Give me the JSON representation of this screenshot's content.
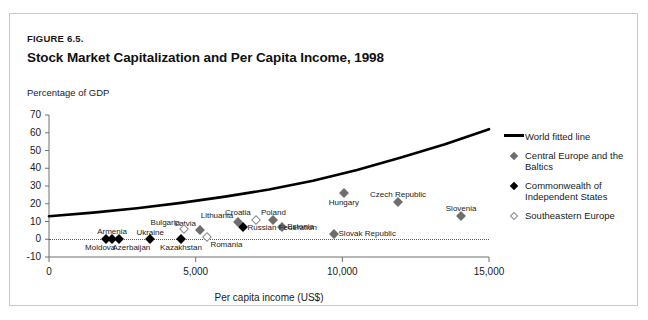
{
  "figure": {
    "label": "Figure 6.5.",
    "title": "Stock Market Capitalization and Per Capita Income, 1998"
  },
  "chart_data": {
    "type": "scatter",
    "title": "Stock Market Capitalization and Per Capita Income, 1998",
    "subtitle": "Figure 6.5.",
    "xlabel": "Per capita income (US$)",
    "ylabel": "Percentage of GDP",
    "xlim": [
      0,
      15000
    ],
    "ylim": [
      -10,
      70
    ],
    "xticks": [
      0,
      5000,
      10000,
      15000
    ],
    "xticklabels": [
      "0",
      "5,000",
      "10,000",
      "15,000"
    ],
    "yticks": [
      -10,
      0,
      10,
      20,
      30,
      40,
      50,
      60,
      70
    ],
    "yticklabels": [
      "-10",
      "0",
      "10",
      "20",
      "30",
      "40",
      "50",
      "60",
      "70"
    ],
    "grid": false,
    "zero_reference_line": true,
    "legend_position": "right",
    "series": [
      {
        "name": "World fitted line",
        "marker": "line",
        "color": "#000000",
        "type": "line",
        "x": [
          0,
          1500,
          3000,
          4500,
          6000,
          7500,
          9000,
          10500,
          12000,
          13500,
          15000
        ],
        "y": [
          13,
          15,
          17.5,
          20.5,
          24,
          28,
          33,
          39,
          46,
          53.5,
          62
        ]
      },
      {
        "name": "Central Europe and the Baltics",
        "marker": "gray-diamond",
        "color": "#6e6e6e",
        "points": [
          {
            "label": "Latvia",
            "x": 5150,
            "y": 5,
            "label_anchor": "right",
            "label_dx": -4,
            "label_dy": -11
          },
          {
            "label": "Lithuania",
            "x": 6450,
            "y": 10,
            "label_anchor": "right",
            "label_dx": -5,
            "label_dy": -11
          },
          {
            "label": "Poland",
            "x": 7650,
            "y": 11,
            "label_anchor": "center",
            "label_dx": 0,
            "label_dy": -12
          },
          {
            "label": "Estonia",
            "x": 7950,
            "y": 7,
            "label_anchor": "left",
            "label_dx": 5,
            "label_dy": -5
          },
          {
            "label": "Hungary",
            "x": 10050,
            "y": 26,
            "label_anchor": "center",
            "label_dx": 0,
            "label_dy": 5
          },
          {
            "label": "Czech Republic",
            "x": 11900,
            "y": 21,
            "label_anchor": "center",
            "label_dx": 0,
            "label_dy": -12
          },
          {
            "label": "Slovenia",
            "x": 14050,
            "y": 13,
            "label_anchor": "center",
            "label_dx": 0,
            "label_dy": -12
          },
          {
            "label": "Slovak Republic",
            "x": 9700,
            "y": 3,
            "label_anchor": "left",
            "label_dx": 5,
            "label_dy": -5
          }
        ]
      },
      {
        "name": "Commonwealth of Independent States",
        "marker": "black-diamond",
        "color": "#000000",
        "points": [
          {
            "label": "Moldova",
            "x": 1950,
            "y": 0,
            "label_anchor": "center",
            "label_dx": -6,
            "label_dy": 4
          },
          {
            "label": "Armenia",
            "x": 2150,
            "y": 0,
            "label_anchor": "center",
            "label_dx": 0,
            "label_dy": -12
          },
          {
            "label": "Azerbaijan",
            "x": 2400,
            "y": 0,
            "label_anchor": "center",
            "label_dx": 12,
            "label_dy": 4
          },
          {
            "label": "Ukraine",
            "x": 3450,
            "y": 0,
            "label_anchor": "center",
            "label_dx": 0,
            "label_dy": -11
          },
          {
            "label": "Kazakhstan",
            "x": 4500,
            "y": 0,
            "label_anchor": "center",
            "label_dx": 0,
            "label_dy": 4
          },
          {
            "label": "Russian Federation",
            "x": 6600,
            "y": 7,
            "label_anchor": "left",
            "label_dx": 5,
            "label_dy": -4
          }
        ]
      },
      {
        "name": "Southeastern Europe",
        "marker": "open-diamond",
        "color": "#ffffff",
        "points": [
          {
            "label": "Bulgaria",
            "x": 4600,
            "y": 6,
            "label_anchor": "right",
            "label_dx": -4,
            "label_dy": -11
          },
          {
            "label": "Romania",
            "x": 5400,
            "y": 1,
            "label_anchor": "left",
            "label_dx": 3,
            "label_dy": 3
          },
          {
            "label": "Croatia",
            "x": 7050,
            "y": 11,
            "label_anchor": "right",
            "label_dx": -5,
            "label_dy": -12
          }
        ]
      }
    ]
  },
  "legend": {
    "items": [
      {
        "label": "World fitted line",
        "marker": "line"
      },
      {
        "label": "Central Europe and the Baltics",
        "marker": "gray-diamond"
      },
      {
        "label": "Commonwealth of Independent States",
        "marker": "black-diamond"
      },
      {
        "label": "Southeastern Europe",
        "marker": "open-diamond"
      }
    ]
  }
}
